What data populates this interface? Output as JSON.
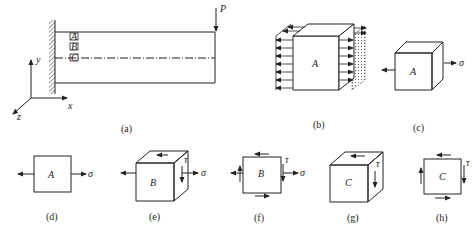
{
  "figure": {
    "panels": [
      {
        "id": "a",
        "caption": "(a)",
        "description": "cantilever beam fixed at left wall, point load P at free end"
      },
      {
        "id": "b",
        "caption": "(b)",
        "description": "element A cut from beam with distributed normal stress arrows"
      },
      {
        "id": "c",
        "caption": "(c)",
        "description": "element A under uniaxial tension sigma"
      },
      {
        "id": "d",
        "caption": "(d)",
        "description": "plane view of element A under sigma"
      },
      {
        "id": "e",
        "caption": "(e)",
        "description": "element B with sigma and shear tau"
      },
      {
        "id": "f",
        "caption": "(f)",
        "description": "plane view of element B with sigma and tau"
      },
      {
        "id": "g",
        "caption": "(g)",
        "description": "element C under pure shear tau"
      },
      {
        "id": "h",
        "caption": "(h)",
        "description": "plane view of element C under pure shear tau"
      }
    ],
    "beam": {
      "load_label": "P",
      "points": [
        "A",
        "B",
        "C"
      ],
      "axes": {
        "x": "x",
        "y": "y",
        "z": "z"
      }
    },
    "symbols": {
      "sigma": "σ",
      "tau": "τ"
    },
    "element_labels": {
      "A": "A",
      "B": "B",
      "C": "C"
    }
  }
}
